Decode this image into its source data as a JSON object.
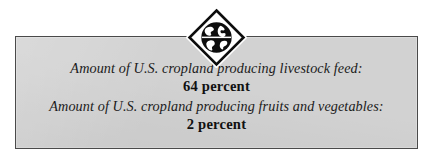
{
  "panel": {
    "name": "statistics-callout",
    "background_color": "#d2d2d2",
    "border_color": "#4a4a4a"
  },
  "medallion": {
    "icon": "globe-diamond-icon",
    "shape": "diamond",
    "inner_icon": "globe-icon",
    "fill_color": "#000000",
    "frame_color": "#ffffff"
  },
  "stats": [
    {
      "label": "Amount of U.S. cropland producing livestock feed:",
      "value": "64 percent"
    },
    {
      "label": "Amount of U.S. cropland producing fruits and vegetables:",
      "value": "2 percent"
    }
  ]
}
